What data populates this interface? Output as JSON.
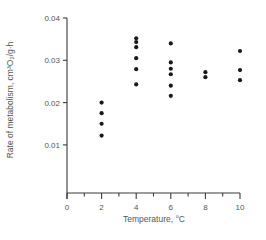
{
  "chart_data": {
    "type": "scatter",
    "title": "",
    "xlabel": "Temperature, °C",
    "ylabel": "Rate of metabolism, cm³O₂/g·h",
    "xlim": [
      0,
      10
    ],
    "ylim": [
      0,
      0.04
    ],
    "x_ticks": [
      0,
      2,
      4,
      6,
      8,
      10
    ],
    "x_tick_labels": [
      "0",
      "2",
      "4",
      "6",
      "8",
      "10"
    ],
    "x_minor_ticks": [
      1,
      3,
      5,
      7,
      9
    ],
    "y_ticks": [
      0.01,
      0.02,
      0.03,
      0.04
    ],
    "y_tick_labels": [
      "0.01",
      "0.02",
      "0.03",
      "0.04"
    ],
    "grid": false,
    "legend": null,
    "series": [
      {
        "name": "Metabolic rate",
        "color": "#1a1a1a",
        "points": [
          {
            "x": 2,
            "y": 0.02
          },
          {
            "x": 2,
            "y": 0.0175
          },
          {
            "x": 2,
            "y": 0.015
          },
          {
            "x": 2,
            "y": 0.0122
          },
          {
            "x": 4,
            "y": 0.0352
          },
          {
            "x": 4,
            "y": 0.0343
          },
          {
            "x": 4,
            "y": 0.0331
          },
          {
            "x": 4,
            "y": 0.0305
          },
          {
            "x": 4,
            "y": 0.0279
          },
          {
            "x": 4,
            "y": 0.0243
          },
          {
            "x": 6,
            "y": 0.034
          },
          {
            "x": 6,
            "y": 0.0295
          },
          {
            "x": 6,
            "y": 0.028
          },
          {
            "x": 6,
            "y": 0.0267
          },
          {
            "x": 6,
            "y": 0.024
          },
          {
            "x": 6,
            "y": 0.0216
          },
          {
            "x": 8,
            "y": 0.0272
          },
          {
            "x": 8,
            "y": 0.026
          },
          {
            "x": 10,
            "y": 0.0322
          },
          {
            "x": 10,
            "y": 0.0277
          },
          {
            "x": 10,
            "y": 0.0253
          }
        ]
      }
    ]
  },
  "layout": {
    "x0_px": 67,
    "x_per_unit_px": 17.3,
    "y_ref_value": 0.04,
    "y_ref_px": 18,
    "y_px_per_001": 42.3,
    "x_axis_y_px": 193,
    "y_axis_top_px": 18
  }
}
